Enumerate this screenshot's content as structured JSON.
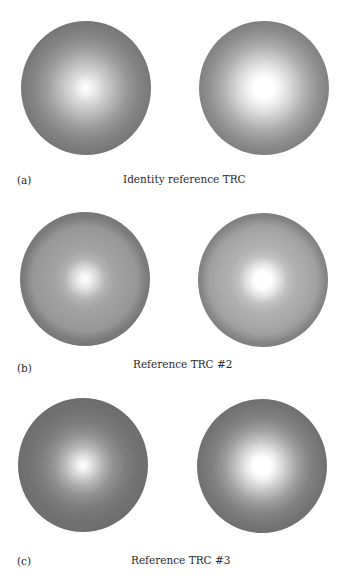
{
  "figure": {
    "panels": [
      {
        "letter": "(a)",
        "caption": "Identity reference TRC",
        "images": [
          {
            "description": "radial gray gradient disc, small bright center"
          },
          {
            "description": "radial gray gradient disc, larger bright center"
          }
        ]
      },
      {
        "letter": "(b)",
        "caption": "Reference TRC #2",
        "images": [
          {
            "description": "radial gray gradient disc with visible mid-tone ring banding, small bright center"
          },
          {
            "description": "radial gray gradient disc with visible mid-tone ring banding, larger bright center"
          }
        ]
      },
      {
        "letter": "(c)",
        "caption": "Reference TRC #3",
        "images": [
          {
            "description": "radial gray gradient disc, compressed small bright center"
          },
          {
            "description": "radial gray gradient disc, compressed larger bright center"
          }
        ]
      }
    ],
    "colors": {
      "background": "#ffffff",
      "disc_edge_gray": "#6a6a6a",
      "disc_center": "#ffffff",
      "text": "#2a2a2a"
    }
  }
}
